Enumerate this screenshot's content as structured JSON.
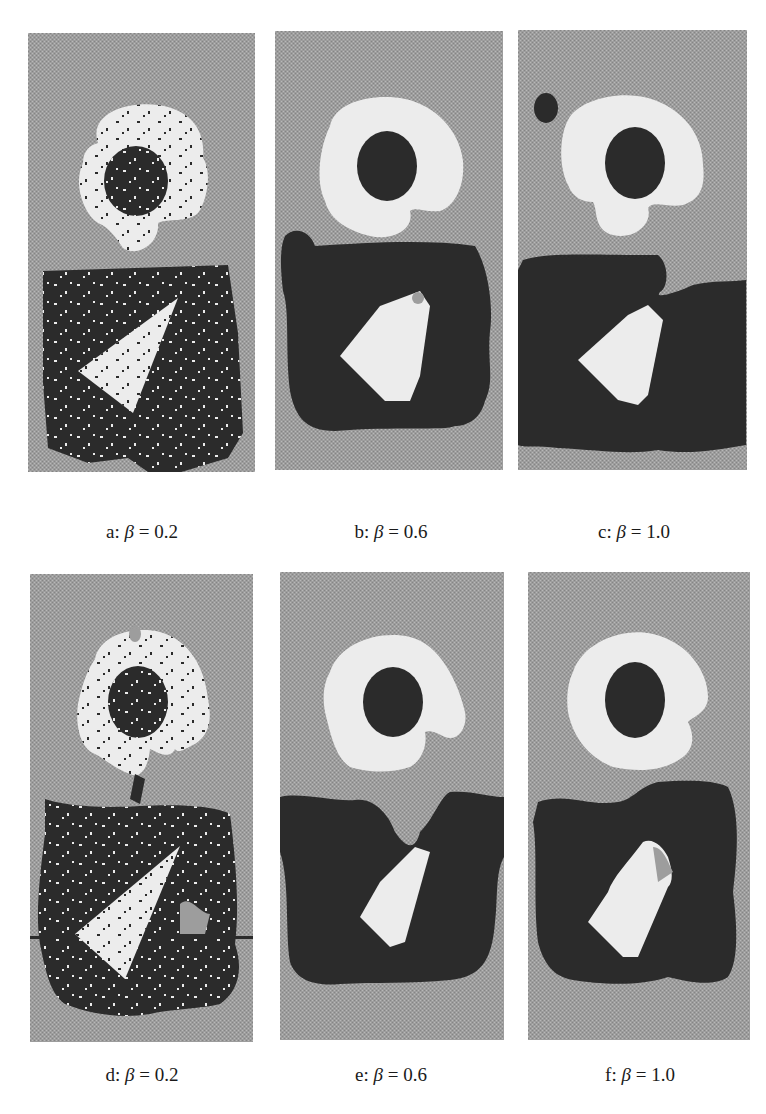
{
  "figure": {
    "colors": {
      "background_gray": "#9d9d9d",
      "light_region": "#ececec",
      "dark_region": "#2b2b2b",
      "page": "#ffffff"
    },
    "panels": [
      {
        "id": "a",
        "letter": "a:",
        "symbol": "β",
        "equals": "= 0.2",
        "beta": 0.2,
        "row": 1,
        "noise": "high"
      },
      {
        "id": "b",
        "letter": "b:",
        "symbol": "β",
        "equals": "= 0.6",
        "beta": 0.6,
        "row": 1,
        "noise": "low"
      },
      {
        "id": "c",
        "letter": "c:",
        "symbol": "β",
        "equals": "= 1.0",
        "beta": 1.0,
        "row": 1,
        "noise": "none"
      },
      {
        "id": "d",
        "letter": "d:",
        "symbol": "β",
        "equals": "= 0.2",
        "beta": 0.2,
        "row": 2,
        "noise": "high"
      },
      {
        "id": "e",
        "letter": "e:",
        "symbol": "β",
        "equals": "= 0.6",
        "beta": 0.6,
        "row": 2,
        "noise": "low"
      },
      {
        "id": "f",
        "letter": "f:",
        "symbol": "β",
        "equals": "= 1.0",
        "beta": 1.0,
        "row": 2,
        "noise": "none"
      }
    ]
  }
}
